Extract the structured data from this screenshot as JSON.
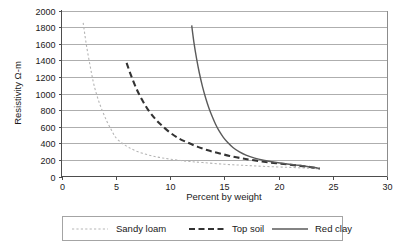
{
  "chart_data": {
    "type": "line",
    "title": "",
    "xlabel": "Percent by weight",
    "ylabel": "Resistivity Ω-m",
    "xlim": [
      0,
      30
    ],
    "ylim": [
      0,
      2000
    ],
    "xticks": [
      0,
      5,
      10,
      15,
      20,
      25,
      30
    ],
    "yticks": [
      0,
      200,
      400,
      600,
      800,
      1000,
      1200,
      1400,
      1600,
      1800,
      2000
    ],
    "grid": "horizontal",
    "legend_position": "bottom",
    "series": [
      {
        "name": "Sandy loam",
        "style": "dotted",
        "color": "#b5b5b5",
        "x": [
          2.0,
          2.3,
          2.7,
          3.0,
          3.4,
          3.8,
          4.2,
          4.6,
          5.0,
          5.6,
          6.2,
          7.0,
          8.0,
          9.0,
          10.0,
          11.5,
          13.0,
          15.0,
          17.0,
          19.0,
          21.0,
          23.0,
          23.8
        ],
        "y": [
          1850,
          1580,
          1290,
          1100,
          920,
          780,
          660,
          560,
          470,
          400,
          350,
          300,
          260,
          230,
          210,
          185,
          168,
          148,
          133,
          120,
          110,
          98,
          92
        ]
      },
      {
        "name": "Top soil",
        "style": "dashed",
        "color": "#333333",
        "x": [
          6.0,
          6.4,
          6.9,
          7.4,
          8.0,
          8.6,
          9.2,
          10.0,
          10.8,
          11.6,
          12.5,
          13.5,
          14.5,
          15.5,
          16.5,
          17.5,
          19.0,
          20.5,
          22.0,
          23.0,
          23.8
        ],
        "y": [
          1370,
          1220,
          1060,
          930,
          800,
          700,
          620,
          530,
          460,
          410,
          360,
          315,
          280,
          248,
          222,
          200,
          172,
          150,
          128,
          112,
          95
        ]
      },
      {
        "name": "Red clay",
        "style": "solid",
        "color": "#5a5a5a",
        "x": [
          12.0,
          12.2,
          12.45,
          12.7,
          13.0,
          13.3,
          13.6,
          13.9,
          14.2,
          14.5,
          14.9,
          15.3,
          15.8,
          16.4,
          17.0,
          17.8,
          18.6,
          19.5,
          20.5,
          21.5,
          22.5,
          23.3,
          23.8
        ],
        "y": [
          1820,
          1620,
          1420,
          1250,
          1080,
          940,
          820,
          720,
          630,
          555,
          475,
          412,
          350,
          296,
          258,
          222,
          196,
          175,
          156,
          140,
          124,
          108,
          95
        ]
      }
    ]
  },
  "axes": {
    "x_title": "Percent by weight",
    "y_title": "Resistivity Ω-m",
    "x_tick_labels": [
      "0",
      "5",
      "10",
      "15",
      "20",
      "25",
      "30"
    ],
    "y_tick_labels": [
      "0",
      "200",
      "400",
      "600",
      "800",
      "1000",
      "1200",
      "1400",
      "1600",
      "1800",
      "2000"
    ]
  },
  "legend": {
    "entries": [
      {
        "label": "Sandy loam",
        "swatch": "dotted-line-swatch"
      },
      {
        "label": "Top soil",
        "swatch": "dashed-line-swatch"
      },
      {
        "label": "Red clay",
        "swatch": "solid-line-swatch"
      }
    ]
  },
  "colors": {
    "sandy_loam": "#b5b5b5",
    "top_soil": "#333333",
    "red_clay": "#5a5a5a",
    "grid": "#9a9a9a",
    "frame": "#808080",
    "axis": "#4d4d4d",
    "background": "#ffffff"
  }
}
